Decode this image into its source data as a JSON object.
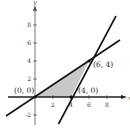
{
  "diagram": {
    "type": "coordinate-plane-feasible-region",
    "axes": {
      "x_label": "x",
      "y_label": "y",
      "x_ticks": [
        "2",
        "4",
        "6",
        "8"
      ],
      "y_ticks": [
        "8",
        "6",
        "4",
        "2",
        "-2"
      ]
    },
    "vertices": [
      {
        "label": "(0, 0)",
        "x": 0,
        "y": 0
      },
      {
        "label": "(4, 0)",
        "x": 4,
        "y": 0
      },
      {
        "label": "(6, 4)",
        "x": 6,
        "y": 4
      }
    ],
    "lines": [
      {
        "name": "line-through-origin-and-6-4",
        "slope": 0.6667,
        "intercept": 0
      },
      {
        "name": "line-through-4-0-and-6-4",
        "slope": 2,
        "intercept": -8
      }
    ],
    "region": {
      "fill": "#c8c8c8",
      "description": "shaded triangle"
    },
    "colors": {
      "line": "#111111",
      "axis": "#222222",
      "fill": "#c8c8c8"
    }
  }
}
